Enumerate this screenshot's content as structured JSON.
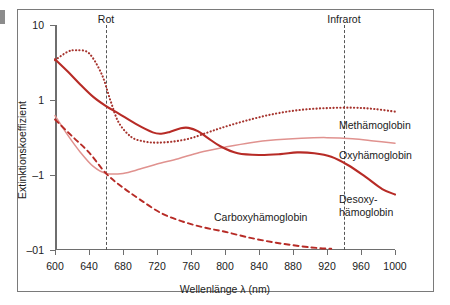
{
  "figure": {
    "background": "#ffffff",
    "frame_color": "#7a7a7a"
  },
  "chart_data": {
    "type": "line",
    "title": "",
    "xlabel": "Wellenlänge λ (nm)",
    "ylabel": "Extinktionskoeffizient",
    "xlim": [
      600,
      1000
    ],
    "xticks": [
      600,
      640,
      680,
      720,
      760,
      800,
      840,
      880,
      920,
      960,
      1000
    ],
    "xtick_labels": [
      "600",
      "640",
      "680",
      "720",
      "760",
      "800",
      "840",
      "880",
      "920",
      "960",
      "1000"
    ],
    "yscale": "log",
    "yticks": [
      10,
      1,
      0.1,
      0.01
    ],
    "ytick_labels": [
      "10",
      "1",
      "–1",
      "–01"
    ],
    "grid": false,
    "legend": "inline-right-labels",
    "annotations": [
      {
        "name": "Rot",
        "x": 660,
        "label": "Rot"
      },
      {
        "name": "Infrarot",
        "x": 940,
        "label": "Infrarot"
      }
    ],
    "series": [
      {
        "name": "Methämoglobin",
        "label": "Methämoglobin",
        "color": "#a6342e",
        "style": "dotted",
        "x": [
          600,
          615,
          625,
          640,
          655,
          665,
          675,
          690,
          705,
          720,
          740,
          760,
          780,
          800,
          830,
          860,
          890,
          920,
          950,
          975,
          1000
        ],
        "values": [
          3.4,
          4.4,
          4.6,
          4.2,
          2.2,
          1.0,
          0.5,
          0.32,
          0.28,
          0.27,
          0.28,
          0.31,
          0.37,
          0.44,
          0.55,
          0.66,
          0.74,
          0.78,
          0.79,
          0.76,
          0.7
        ]
      },
      {
        "name": "Oxyhämoglobin",
        "label": "Oxyhämoglobin",
        "color": "#e0928f",
        "style": "solid",
        "x": [
          600,
          615,
          630,
          645,
          660,
          680,
          700,
          720,
          745,
          770,
          800,
          830,
          860,
          890,
          920,
          950,
          975,
          1000
        ],
        "values": [
          0.62,
          0.34,
          0.2,
          0.13,
          0.105,
          0.105,
          0.12,
          0.14,
          0.165,
          0.2,
          0.235,
          0.27,
          0.295,
          0.31,
          0.315,
          0.305,
          0.285,
          0.265
        ]
      },
      {
        "name": "Desoxyhämoglobin",
        "label": "Desoxy-\nhämoglobin",
        "label_line1": "Desoxy-",
        "label_line2": "hämoglobin",
        "color": "#b72b26",
        "style": "solid",
        "x": [
          600,
          615,
          630,
          645,
          660,
          675,
          695,
          715,
          725,
          735,
          748,
          757,
          768,
          780,
          795,
          815,
          840,
          865,
          885,
          905,
          925,
          945,
          965,
          985,
          1000
        ],
        "values": [
          3.5,
          2.4,
          1.6,
          1.1,
          0.83,
          0.66,
          0.48,
          0.37,
          0.355,
          0.375,
          0.42,
          0.425,
          0.385,
          0.31,
          0.24,
          0.195,
          0.185,
          0.19,
          0.2,
          0.195,
          0.175,
          0.135,
          0.095,
          0.065,
          0.055
        ]
      },
      {
        "name": "Carboxyhämoglobin",
        "label": "Carboxyhämoglobin",
        "color": "#b72b26",
        "style": "dashed",
        "x": [
          600,
          620,
          640,
          660,
          680,
          700,
          725,
          750,
          775,
          800,
          830,
          860,
          890,
          910,
          925
        ],
        "values": [
          0.55,
          0.33,
          0.2,
          0.105,
          0.068,
          0.047,
          0.031,
          0.024,
          0.02,
          0.0175,
          0.0145,
          0.0125,
          0.0112,
          0.0106,
          0.0104
        ]
      }
    ]
  },
  "labels": {
    "meth": "Methämoglobin",
    "oxy": "Oxyhämoglobin",
    "desoxy_line1": "Desoxy-",
    "desoxy_line2": "hämoglobin",
    "carboxy": "Carboxyhämoglobin",
    "rot": "Rot",
    "infrarot": "Infrarot"
  },
  "axes": {
    "x_title": "Wellenlänge λ (nm)",
    "y_title": "Extinktionskoeffizient",
    "x_ticks": [
      "600",
      "640",
      "680",
      "720",
      "760",
      "800",
      "840",
      "880",
      "920",
      "960",
      "1000"
    ],
    "y_ticks": [
      "10",
      "1",
      "–1",
      "–01"
    ]
  }
}
